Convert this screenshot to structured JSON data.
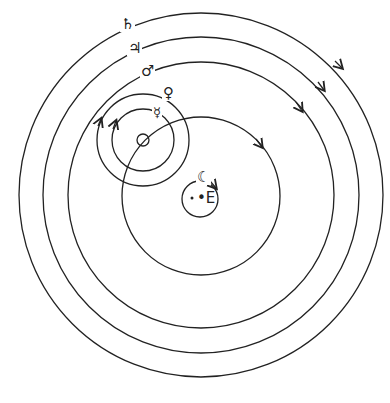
{
  "bodies": {
    "saturn": {
      "symbol": "♄"
    },
    "jupiter": {
      "symbol": "♃"
    },
    "mars": {
      "symbol": "♂"
    },
    "venus": {
      "symbol": "♀"
    },
    "mercury": {
      "symbol": "☿"
    },
    "moon": {
      "symbol": "☾"
    },
    "earth": {
      "symbol": "•E"
    }
  },
  "colors": {
    "line": "#222222",
    "background": "#ffffff"
  }
}
